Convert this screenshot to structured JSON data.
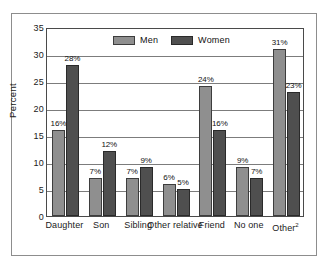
{
  "chart_data": {
    "type": "bar",
    "title": "",
    "xlabel": "",
    "ylabel": "Percent",
    "ylim": [
      0,
      35
    ],
    "ytick_step": 5,
    "yticks": [
      "0",
      "5",
      "10",
      "15",
      "20",
      "25",
      "30",
      "35"
    ],
    "grid": true,
    "legend_position": "top-center",
    "categories": [
      "Daughter",
      "Son",
      "Sibling",
      "Other relative",
      "Friend",
      "No one",
      "Other"
    ],
    "category_superscripts": [
      "",
      "",
      "",
      "",
      "",
      "",
      "2"
    ],
    "series": [
      {
        "name": "Men",
        "color": "#8f8f8f",
        "values": [
          16,
          7,
          7,
          6,
          24,
          9,
          31
        ],
        "labels": [
          "16%",
          "7%",
          "7%",
          "6%",
          "24%",
          "9%",
          "31%"
        ]
      },
      {
        "name": "Women",
        "color": "#4f4f4f",
        "values": [
          28,
          12,
          9,
          5,
          16,
          7,
          23
        ],
        "labels": [
          "28%",
          "12%",
          "9%",
          "5%",
          "16%",
          "7%",
          "23%"
        ]
      }
    ]
  },
  "legend": {
    "items": [
      {
        "label": "Men"
      },
      {
        "label": "Women"
      }
    ]
  },
  "axis": {
    "y_title": "Percent"
  },
  "colors": {
    "men_bar": "#8f8f8f",
    "women_bar": "#4f4f4f",
    "frame": "#8d8d8d",
    "plot_border": "#4a4a4a",
    "gridline": "#7c7c7c",
    "background": "#ffffff"
  }
}
